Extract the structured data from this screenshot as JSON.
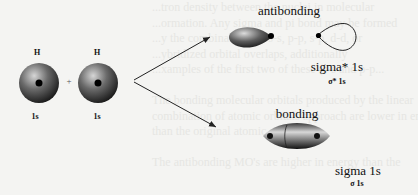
{
  "background_text_lines": [
    "...tron density between the nuclei in molecular",
    "...ormation. Any sigma and pi bond may be formed",
    "...y the combinations of s-s, p-p, s-p, d-d, or",
    "...ybridized orbital overlaps, additionally",
    "...xamples of the first two of these (s-s and p-p...",
    "",
    "The bonding molecular orbitals produced by the linear",
    "combination of atomic orbitals approach are lower in energy",
    "than the original atomic orbitals.",
    "",
    "The antibonding MO's are higher in energy than the"
  ],
  "atoms": [
    {
      "element": "H",
      "orbital": "1s"
    },
    {
      "element": "H",
      "orbital": "1s"
    }
  ],
  "plus_sign": "+",
  "antibonding": {
    "title": "antibonding",
    "name": "sigma* 1s",
    "symbol": "σ* 1s"
  },
  "bonding": {
    "title": "bonding",
    "name": "sigma 1s",
    "symbol": "σ 1s"
  },
  "colors": {
    "background": "#f4f4f2",
    "ghost_text": "#e6e6e3",
    "sphere_dark": "#1a1a1a",
    "sphere_light": "#cfcfcf",
    "line": "#222222"
  }
}
